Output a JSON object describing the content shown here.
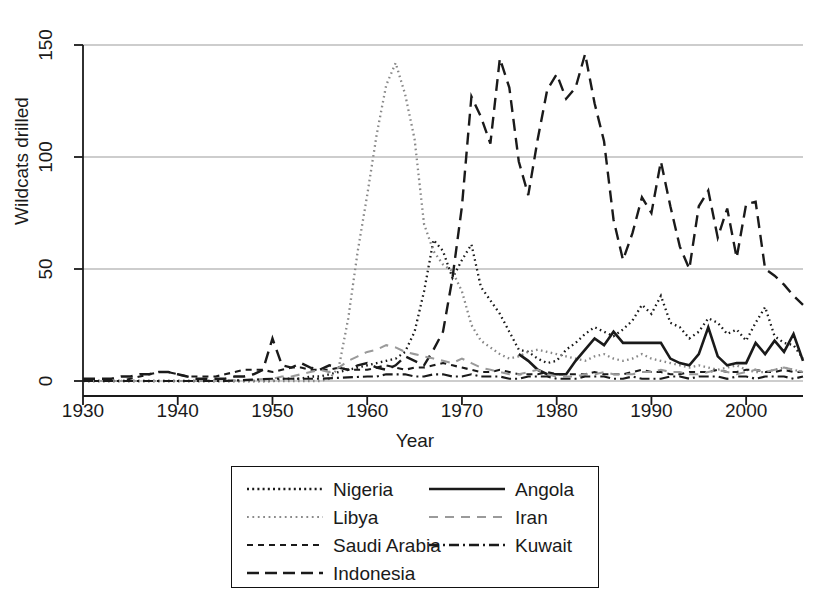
{
  "chart_data": {
    "type": "line",
    "title": "",
    "xlabel": "Year",
    "ylabel": "Wildcats drilled",
    "xlim": [
      1930,
      2006
    ],
    "ylim": [
      0,
      150
    ],
    "xticks": [
      1930,
      1940,
      1950,
      1960,
      1970,
      1980,
      1990,
      2000
    ],
    "yticks": [
      0,
      50,
      100,
      150
    ],
    "grid": "horizontal",
    "legend_position": "below-plot",
    "series": [
      {
        "name": "Nigeria",
        "style": "dotted",
        "color": "#1a1a1a",
        "x": [
          1930,
          1931,
          1932,
          1933,
          1934,
          1935,
          1936,
          1937,
          1938,
          1939,
          1940,
          1941,
          1942,
          1943,
          1944,
          1945,
          1946,
          1947,
          1948,
          1949,
          1950,
          1951,
          1952,
          1953,
          1954,
          1955,
          1956,
          1957,
          1958,
          1959,
          1960,
          1961,
          1962,
          1963,
          1964,
          1965,
          1966,
          1967,
          1968,
          1969,
          1970,
          1971,
          1972,
          1973,
          1974,
          1975,
          1976,
          1977,
          1978,
          1979,
          1980,
          1981,
          1982,
          1983,
          1984,
          1985,
          1986,
          1987,
          1988,
          1989,
          1990,
          1991,
          1992,
          1993,
          1994,
          1995,
          1996,
          1997,
          1998,
          1999,
          2000,
          2001,
          2002,
          2003,
          2004,
          2005,
          2006
        ],
        "y": [
          0,
          0,
          0,
          0,
          0,
          0,
          0,
          0,
          0,
          0,
          0,
          0,
          0,
          0,
          0,
          0,
          0,
          0,
          0,
          0,
          0,
          1,
          1,
          1,
          2,
          2,
          3,
          4,
          5,
          6,
          7,
          8,
          9,
          10,
          13,
          22,
          40,
          63,
          58,
          46,
          54,
          61,
          42,
          36,
          30,
          22,
          14,
          13,
          10,
          8,
          9,
          14,
          17,
          21,
          24,
          22,
          20,
          23,
          27,
          34,
          30,
          38,
          26,
          24,
          19,
          22,
          28,
          26,
          21,
          23,
          18,
          26,
          33,
          20,
          17,
          16,
          10
        ]
      },
      {
        "name": "Libya",
        "style": "dotted",
        "color": "#888888",
        "x": [
          1930,
          1935,
          1940,
          1945,
          1950,
          1955,
          1956,
          1957,
          1958,
          1959,
          1960,
          1961,
          1962,
          1963,
          1964,
          1965,
          1966,
          1967,
          1968,
          1969,
          1970,
          1971,
          1972,
          1973,
          1974,
          1975,
          1976,
          1977,
          1978,
          1979,
          1980,
          1981,
          1982,
          1983,
          1984,
          1985,
          1986,
          1987,
          1988,
          1989,
          1990,
          1991,
          1992,
          1993,
          1994,
          1995,
          1996,
          1997,
          1998,
          1999,
          2000,
          2001,
          2002,
          2003,
          2004,
          2005,
          2006
        ],
        "y": [
          0,
          0,
          0,
          0,
          0,
          0,
          1,
          6,
          28,
          58,
          83,
          110,
          132,
          142,
          128,
          108,
          70,
          58,
          52,
          49,
          40,
          25,
          18,
          15,
          12,
          10,
          11,
          13,
          14,
          13,
          12,
          11,
          10,
          9,
          11,
          12,
          10,
          9,
          10,
          12,
          10,
          9,
          8,
          7,
          6,
          7,
          6,
          5,
          6,
          7,
          5,
          4,
          4,
          5,
          6,
          5,
          4
        ]
      },
      {
        "name": "Saudi Arabia",
        "style": "dashed-short",
        "color": "#1a1a1a",
        "x": [
          1930,
          1931,
          1932,
          1933,
          1934,
          1935,
          1936,
          1937,
          1938,
          1939,
          1940,
          1941,
          1942,
          1943,
          1944,
          1945,
          1946,
          1947,
          1948,
          1949,
          1950,
          1951,
          1952,
          1953,
          1954,
          1955,
          1956,
          1957,
          1958,
          1959,
          1960,
          1961,
          1962,
          1963,
          1964,
          1965,
          1966,
          1967,
          1968,
          1969,
          1970,
          1971,
          1972,
          1973,
          1974,
          1975,
          1976,
          1977,
          1978,
          1979,
          1980,
          1981,
          1982,
          1983,
          1984,
          1985,
          1986,
          1987,
          1988,
          1989,
          1990,
          1991,
          1992,
          1993,
          1994,
          1995,
          1996,
          1997,
          1998,
          1999,
          2000,
          2001,
          2002,
          2003,
          2004,
          2005,
          2006
        ],
        "y": [
          0,
          0,
          0,
          0,
          0,
          1,
          2,
          3,
          4,
          4,
          3,
          2,
          2,
          2,
          2,
          3,
          4,
          5,
          5,
          5,
          4,
          5,
          6,
          6,
          5,
          5,
          5,
          6,
          5,
          5,
          5,
          6,
          7,
          6,
          5,
          6,
          6,
          7,
          8,
          7,
          6,
          5,
          4,
          4,
          5,
          4,
          3,
          3,
          3,
          4,
          3,
          3,
          3,
          3,
          4,
          3,
          3,
          3,
          4,
          5,
          4,
          4,
          3,
          3,
          4,
          4,
          4,
          5,
          4,
          4,
          5,
          5,
          4,
          4,
          5,
          4,
          4
        ]
      },
      {
        "name": "Indonesia",
        "style": "dashed-long",
        "color": "#1a1a1a",
        "x": [
          1930,
          1931,
          1932,
          1933,
          1934,
          1935,
          1936,
          1937,
          1938,
          1939,
          1940,
          1941,
          1942,
          1943,
          1944,
          1945,
          1946,
          1947,
          1948,
          1949,
          1950,
          1951,
          1952,
          1953,
          1954,
          1955,
          1956,
          1957,
          1958,
          1959,
          1960,
          1961,
          1962,
          1963,
          1964,
          1965,
          1966,
          1967,
          1968,
          1969,
          1970,
          1971,
          1972,
          1973,
          1974,
          1975,
          1976,
          1977,
          1978,
          1979,
          1980,
          1981,
          1982,
          1983,
          1984,
          1985,
          1986,
          1987,
          1988,
          1989,
          1990,
          1991,
          1992,
          1993,
          1994,
          1995,
          1996,
          1997,
          1998,
          1999,
          2000,
          2001,
          2002,
          2003,
          2004,
          2005,
          2006
        ],
        "y": [
          1,
          1,
          1,
          1,
          2,
          2,
          3,
          3,
          4,
          4,
          3,
          2,
          1,
          1,
          1,
          1,
          2,
          2,
          3,
          5,
          19,
          7,
          6,
          8,
          6,
          5,
          7,
          6,
          5,
          7,
          8,
          6,
          5,
          7,
          11,
          9,
          7,
          14,
          22,
          46,
          78,
          127,
          118,
          106,
          144,
          131,
          98,
          83,
          108,
          130,
          137,
          126,
          131,
          146,
          124,
          107,
          72,
          54,
          66,
          82,
          75,
          98,
          78,
          60,
          50,
          78,
          85,
          64,
          77,
          55,
          79,
          80,
          50,
          47,
          43,
          38,
          34
        ]
      },
      {
        "name": "Angola",
        "style": "solid",
        "color": "#1a1a1a",
        "x": [
          1976,
          1977,
          1978,
          1979,
          1980,
          1981,
          1982,
          1983,
          1984,
          1985,
          1986,
          1987,
          1988,
          1989,
          1990,
          1991,
          1992,
          1993,
          1994,
          1995,
          1996,
          1997,
          1998,
          1999,
          2000,
          2001,
          2002,
          2003,
          2004,
          2005,
          2006
        ],
        "y": [
          12,
          9,
          5,
          3,
          3,
          3,
          9,
          14,
          19,
          16,
          22,
          17,
          17,
          17,
          17,
          17,
          10,
          8,
          7,
          12,
          24,
          11,
          7,
          8,
          8,
          17,
          12,
          18,
          13,
          21,
          9
        ]
      },
      {
        "name": "Iran",
        "style": "dashed-gray",
        "color": "#9a9a9a",
        "x": [
          1930,
          1935,
          1940,
          1945,
          1950,
          1951,
          1952,
          1953,
          1954,
          1955,
          1956,
          1957,
          1958,
          1959,
          1960,
          1961,
          1962,
          1963,
          1964,
          1965,
          1966,
          1967,
          1968,
          1969,
          1970,
          1971,
          1972,
          1973,
          1974,
          1975,
          1976,
          1977,
          1978,
          1979,
          1980,
          1981,
          1982,
          1983,
          1984,
          1985,
          1986,
          1987,
          1988,
          1989,
          1990,
          1991,
          1992,
          1993,
          1994,
          1995,
          1996,
          1997,
          1998,
          1999,
          2000,
          2001,
          2002,
          2003,
          2004,
          2005,
          2006
        ],
        "y": [
          0,
          0,
          0,
          0,
          1,
          2,
          2,
          3,
          4,
          5,
          4,
          6,
          9,
          11,
          13,
          14,
          16,
          15,
          13,
          12,
          11,
          10,
          9,
          8,
          10,
          8,
          6,
          5,
          4,
          3,
          3,
          4,
          5,
          3,
          2,
          2,
          2,
          3,
          3,
          4,
          3,
          3,
          3,
          4,
          4,
          5,
          4,
          4,
          3,
          3,
          4,
          5,
          4,
          3,
          4,
          5,
          4,
          5,
          6,
          5,
          4
        ]
      },
      {
        "name": "Kuwait",
        "style": "dash-dot",
        "color": "#1a1a1a",
        "x": [
          1930,
          1935,
          1940,
          1945,
          1950,
          1955,
          1960,
          1961,
          1962,
          1963,
          1964,
          1965,
          1966,
          1967,
          1968,
          1969,
          1970,
          1971,
          1972,
          1973,
          1974,
          1975,
          1976,
          1977,
          1978,
          1979,
          1980,
          1981,
          1982,
          1983,
          1984,
          1985,
          1986,
          1987,
          1988,
          1989,
          1990,
          1991,
          1992,
          1993,
          1994,
          1995,
          1996,
          1997,
          1998,
          1999,
          2000,
          2001,
          2002,
          2003,
          2004,
          2005,
          2006
        ],
        "y": [
          0,
          0,
          0,
          0,
          1,
          1,
          2,
          2,
          3,
          3,
          3,
          2,
          2,
          3,
          3,
          2,
          2,
          3,
          2,
          2,
          2,
          1,
          1,
          2,
          2,
          2,
          1,
          1,
          1,
          2,
          2,
          2,
          1,
          1,
          2,
          1,
          1,
          1,
          2,
          2,
          1,
          2,
          2,
          2,
          1,
          2,
          2,
          1,
          2,
          2,
          2,
          1,
          2
        ]
      }
    ]
  },
  "axes": {
    "ylabel": "Wildcats drilled",
    "xlabel": "Year",
    "yticks": [
      "0",
      "50",
      "100",
      "150"
    ],
    "xticks": [
      "1930",
      "1940",
      "1950",
      "1960",
      "1970",
      "1980",
      "1990",
      "2000"
    ]
  },
  "legend": {
    "column_left": [
      {
        "label": "Nigeria",
        "sample": "dotted-dark"
      },
      {
        "label": "Libya",
        "sample": "dotted-gray"
      },
      {
        "label": "Saudi Arabia",
        "sample": "dashed-short"
      },
      {
        "label": "Indonesia",
        "sample": "dashed-long"
      }
    ],
    "column_right": [
      {
        "label": "Angola",
        "sample": "solid"
      },
      {
        "label": "Iran",
        "sample": "dashed-gray"
      },
      {
        "label": "Kuwait",
        "sample": "dash-dot"
      }
    ]
  },
  "colors": {
    "axis": "#1a1a1a",
    "grid": "#9b9b9b",
    "dark_series": "#1a1a1a",
    "gray_series": "#9a9a9a",
    "background": "#ffffff"
  }
}
